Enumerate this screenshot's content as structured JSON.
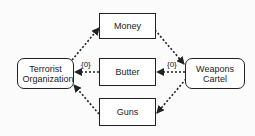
{
  "diagram": {
    "nodes": {
      "terrorist": {
        "label": "Terrorist Organization",
        "shape": "rounded-rect"
      },
      "money": {
        "label": "Money",
        "shape": "rect"
      },
      "butter": {
        "label": "Butter",
        "shape": "rect"
      },
      "guns": {
        "label": "Guns",
        "shape": "rect"
      },
      "weapons": {
        "label": "Weapons Cartel",
        "shape": "rounded-rect"
      }
    },
    "edges": [
      {
        "from": "Terrorist Organization",
        "to": "Money",
        "style": "dotted",
        "label": ""
      },
      {
        "from": "Money",
        "to": "Weapons Cartel",
        "style": "dotted",
        "label": ""
      },
      {
        "from": "Weapons Cartel",
        "to": "Butter",
        "style": "dotted",
        "label": "{0}"
      },
      {
        "from": "Butter",
        "to": "Terrorist Organization",
        "style": "dotted",
        "label": "{0}"
      },
      {
        "from": "Weapons Cartel",
        "to": "Guns",
        "style": "dotted",
        "label": ""
      },
      {
        "from": "Guns",
        "to": "Terrorist Organization",
        "style": "dotted",
        "label": ""
      }
    ],
    "edge_labels": {
      "butter_to_terrorist": "{0}",
      "weapons_to_butter": "{0}"
    }
  }
}
